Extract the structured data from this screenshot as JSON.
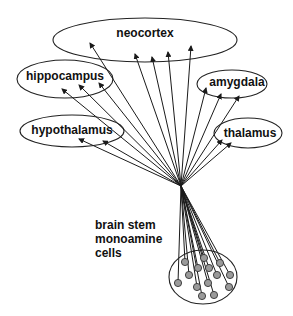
{
  "diagram": {
    "type": "projection-diagram",
    "convergence_point": {
      "x": 181,
      "y": 186
    },
    "regions": [
      {
        "id": "neocortex",
        "label": "neocortex",
        "cx": 145,
        "cy": 40,
        "rx": 92,
        "ry": 22,
        "label_x": 145,
        "label_y": 37,
        "arrow_tips": [
          [
            90,
            43
          ],
          [
            135,
            54
          ],
          [
            152,
            57
          ],
          [
            168,
            52
          ],
          [
            191,
            46
          ]
        ]
      },
      {
        "id": "hippocampus",
        "label": "hippocampus",
        "cx": 65,
        "cy": 79,
        "rx": 48,
        "ry": 19,
        "label_x": 65,
        "label_y": 80,
        "arrow_tips": [
          [
            62,
            89
          ],
          [
            79,
            85
          ],
          [
            99,
            83
          ]
        ]
      },
      {
        "id": "amygdala",
        "label": "amygdala",
        "cx": 232,
        "cy": 84,
        "rx": 35,
        "ry": 14,
        "label_x": 237,
        "label_y": 86,
        "arrow_tips": [
          [
            206,
            88
          ],
          [
            221,
            94
          ],
          [
            239,
            96
          ]
        ]
      },
      {
        "id": "hypothalamus",
        "label": "hypothalamus",
        "cx": 72,
        "cy": 131,
        "rx": 52,
        "ry": 16,
        "label_x": 72,
        "label_y": 134,
        "arrow_tips": [
          [
            79,
            139
          ],
          [
            103,
            141
          ]
        ]
      },
      {
        "id": "thalamus",
        "label": "thalamus",
        "cx": 248,
        "cy": 133,
        "rx": 34,
        "ry": 15,
        "label_x": 250,
        "label_y": 137,
        "arrow_tips": [
          [
            222,
            140
          ],
          [
            231,
            143
          ]
        ]
      }
    ],
    "source": {
      "label_lines": [
        "brain stem",
        "monoamine",
        "cells"
      ],
      "label_x": 95,
      "label_y": [
        229,
        243,
        257
      ],
      "cluster": {
        "cx": 203,
        "cy": 277,
        "rx": 34,
        "ry": 27
      },
      "cells": [
        [
          185,
          262
        ],
        [
          204,
          258
        ],
        [
          220,
          263
        ],
        [
          198,
          268
        ],
        [
          209,
          268
        ],
        [
          189,
          275
        ],
        [
          217,
          275
        ],
        [
          230,
          275
        ],
        [
          178,
          283
        ],
        [
          197,
          287
        ],
        [
          208,
          283
        ],
        [
          229,
          287
        ],
        [
          202,
          296
        ],
        [
          214,
          295
        ]
      ],
      "cell_radius": 3.6
    },
    "colors": {
      "line": "#1a1a1a",
      "cell_fill": "#9a9a9a",
      "background": "#ffffff"
    }
  }
}
